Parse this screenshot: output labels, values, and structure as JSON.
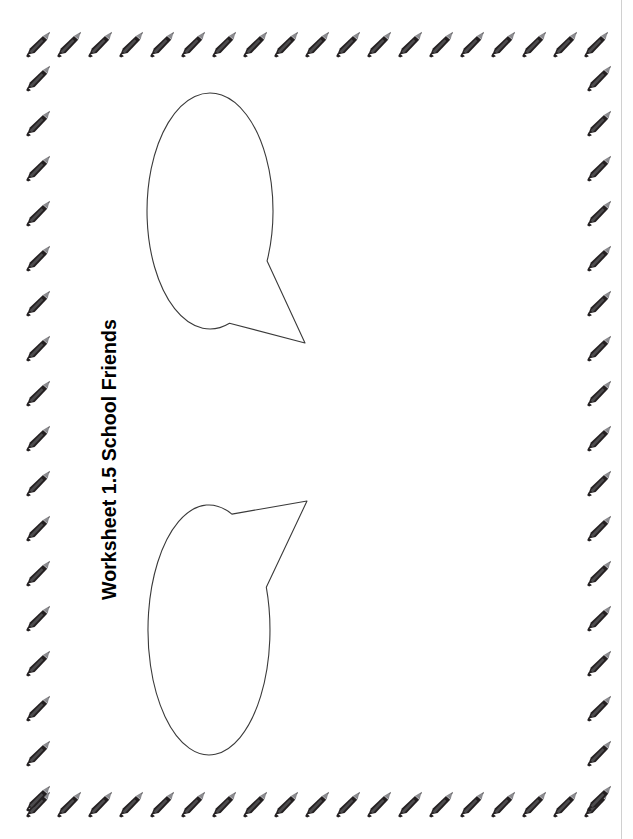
{
  "page": {
    "width": 633,
    "height": 839,
    "background_color": "#ffffff",
    "title": "Worksheet 1.5 School Friends",
    "title_rotation_degrees": -90,
    "edge_rule_color": "#d0d0d0"
  },
  "border": {
    "motif": "pencil-icon",
    "motif_label": "pencil",
    "body_color": "#231f20",
    "highlight_color": "#6f6f73",
    "tip_color": "#8a8a8e",
    "orientation": "diagonal, tip toward upper-right",
    "top_row_count": 19,
    "bottom_row_count": 19,
    "left_column_count": 17,
    "right_column_count": 17,
    "horizontal_spacing": 31,
    "vertical_spacing": 45
  },
  "bubbles": [
    {
      "name": "speech-bubble-top",
      "shape": "ellipse-with-tail",
      "tail_direction": "down-right",
      "fill": "#ffffff",
      "stroke": "#3a3a3a",
      "center_x": 210,
      "center_y": 211,
      "radius_x": 63,
      "radius_y": 118,
      "tail_tip_x": 305,
      "tail_tip_y": 343,
      "content": ""
    },
    {
      "name": "speech-bubble-bottom",
      "shape": "ellipse-with-tail",
      "tail_direction": "up-right",
      "fill": "#ffffff",
      "stroke": "#3a3a3a",
      "center_x": 209,
      "center_y": 630,
      "radius_x": 61,
      "radius_y": 125,
      "tail_tip_x": 307,
      "tail_tip_y": 501,
      "content": ""
    }
  ]
}
